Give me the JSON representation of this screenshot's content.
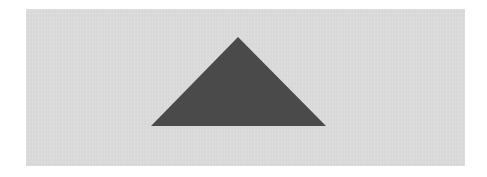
{
  "scene": {
    "background_color": "#ffffff",
    "panel_color": "#dcdcdc",
    "shape": {
      "type": "triangle",
      "fill_color": "#4a4a4a",
      "points": "238,37 151,126 326,126"
    }
  }
}
